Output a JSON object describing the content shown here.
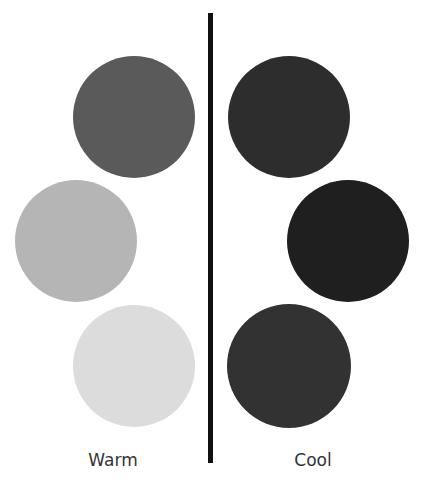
{
  "diagram": {
    "columns": [
      {
        "label": "Warm",
        "circles": [
          {
            "color": "#5a5a5a",
            "cx": 134,
            "cy": 117,
            "r": 61
          },
          {
            "color": "#b5b5b5",
            "cx": 76,
            "cy": 241,
            "r": 61
          },
          {
            "color": "#dcdcdc",
            "cx": 134,
            "cy": 366,
            "r": 61
          }
        ]
      },
      {
        "label": "Cool",
        "circles": [
          {
            "color": "#2d2d2d",
            "cx": 289,
            "cy": 117,
            "r": 61
          },
          {
            "color": "#1f1f1f",
            "cx": 348,
            "cy": 241,
            "r": 61
          },
          {
            "color": "#323232",
            "cx": 289,
            "cy": 366,
            "r": 62
          }
        ]
      }
    ],
    "divider_color": "#111111"
  }
}
